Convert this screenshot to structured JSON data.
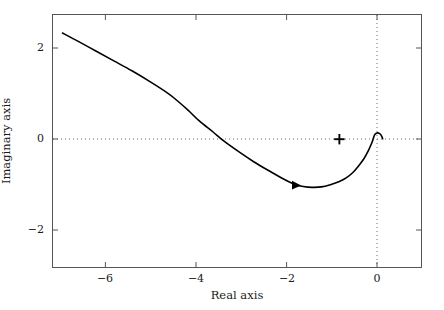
{
  "chart_data": {
    "type": "line",
    "title": "",
    "xlabel": "Real axis",
    "ylabel": "Imaginary axis",
    "xlim": [
      -7.35,
      0.81
    ],
    "ylim": [
      -2.84,
      2.76
    ],
    "xticks": [
      -6,
      -4,
      -2,
      0
    ],
    "xtick_labels": [
      "−6",
      "−4",
      "−2",
      "0"
    ],
    "yticks": [
      2,
      0,
      -2
    ],
    "ytick_labels": [
      "2",
      "0",
      "−2"
    ],
    "grid": false,
    "reference_lines": [
      {
        "name": "real-axis-zero-line",
        "orientation": "horizontal",
        "value": 0,
        "style": "dotted",
        "color": "#6e6e6e"
      },
      {
        "name": "imag-axis-zero-line",
        "orientation": "vertical",
        "value": 0,
        "style": "dotted",
        "color": "#6e6e6e"
      }
    ],
    "series": [
      {
        "name": "nyquist-locus",
        "color": "#000000",
        "linewidth": 1.6,
        "points": [
          [
            -7.14,
            2.36
          ],
          [
            -6.8,
            2.18
          ],
          [
            -6.4,
            1.96
          ],
          [
            -6.0,
            1.74
          ],
          [
            -5.6,
            1.52
          ],
          [
            -5.2,
            1.28
          ],
          [
            -4.8,
            1.02
          ],
          [
            -4.6,
            0.86
          ],
          [
            -4.35,
            0.64
          ],
          [
            -4.35,
            0.0
          ],
          [
            -4.1,
            0.4
          ],
          [
            -3.8,
            0.16
          ],
          [
            -3.55,
            -0.05
          ],
          [
            -3.2,
            -0.3
          ],
          [
            -2.9,
            -0.5
          ],
          [
            -2.6,
            -0.68
          ],
          [
            -2.3,
            -0.85
          ],
          [
            -2.0,
            -1.0
          ],
          [
            -1.8,
            -1.05
          ],
          [
            -1.6,
            -1.07
          ],
          [
            -1.4,
            -1.06
          ],
          [
            -1.2,
            -1.01
          ],
          [
            -1.0,
            -0.94
          ],
          [
            -0.85,
            -0.86
          ],
          [
            -0.7,
            -0.74
          ],
          [
            -0.58,
            -0.6
          ],
          [
            -0.46,
            -0.44
          ],
          [
            -0.36,
            -0.26
          ],
          [
            -0.28,
            -0.08
          ],
          [
            -0.24,
            0.04
          ],
          [
            -0.21,
            0.11
          ],
          [
            -0.15,
            0.14
          ],
          [
            -0.09,
            0.11
          ],
          [
            -0.05,
            0.04
          ],
          [
            -0.04,
            0.01
          ]
        ]
      }
    ],
    "annotations": [
      {
        "name": "plus-marker",
        "label": "+",
        "marker": "plus",
        "x": -1.0,
        "y": 0.0,
        "color": "#000000"
      },
      {
        "name": "direction-arrow",
        "marker": "arrow-right",
        "x": -1.96,
        "y": -1.02,
        "color": "#000000"
      }
    ]
  },
  "axes": {
    "frame_color": "#555555",
    "background": "#ffffff"
  }
}
